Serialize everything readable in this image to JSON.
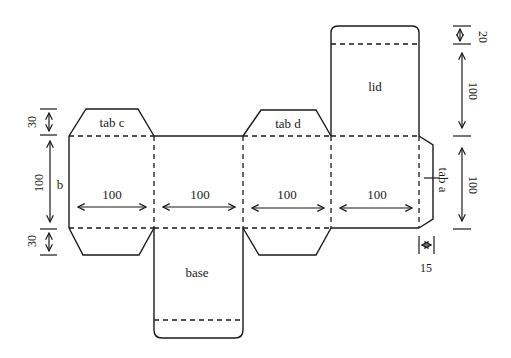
{
  "diagram": {
    "faces": [
      {
        "id": "face-1",
        "width_label": "100"
      },
      {
        "id": "face-2",
        "width_label": "100"
      },
      {
        "id": "face-3",
        "width_label": "100"
      },
      {
        "id": "face-4",
        "width_label": "100"
      }
    ],
    "labels": {
      "lid": "lid",
      "base": "base",
      "tab_a": "tab a",
      "tab_b": "b",
      "tab_c": "tab c",
      "tab_d": "tab d"
    },
    "dimensions": {
      "left_top_tab": "30",
      "left_height": "100",
      "left_bottom_tab": "30",
      "right_lid_flap": "20",
      "right_lid_height": "100",
      "right_face_height": "100",
      "tab_a_width": "15"
    }
  }
}
